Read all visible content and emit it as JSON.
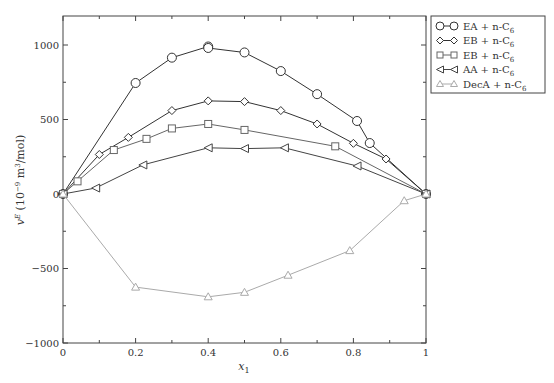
{
  "chart_data": {
    "type": "line",
    "title": "",
    "xlabel": "x_1",
    "ylabel": "v^E (10^-9 m^3/mol)",
    "xlim": [
      0,
      1
    ],
    "ylim": [
      -1000,
      1200
    ],
    "xticks": [
      0,
      0.2,
      0.4,
      0.6,
      0.8,
      1
    ],
    "xtick_labels": [
      "0",
      "0.2",
      "0.4",
      "0.6",
      "0.8",
      "1"
    ],
    "yticks": [
      -1000,
      -500,
      0,
      500,
      1000
    ],
    "ytick_labels": [
      "−1000",
      "−500",
      "0",
      "500",
      "1000"
    ],
    "grid": false,
    "legend_position": "outside-top-right",
    "series": [
      {
        "name": "EA + n-C6",
        "label_main": "EA + n-C",
        "label_sub": "6",
        "marker": "circle",
        "color": "#333333",
        "x": [
          0,
          0.2,
          0.3,
          0.4,
          0.4,
          0.5,
          0.6,
          0.7,
          0.81,
          0.845,
          1
        ],
        "y": [
          0,
          745,
          915,
          990,
          980,
          950,
          825,
          670,
          490,
          342,
          0
        ]
      },
      {
        "name": "EB + n-C6",
        "label_main": "EB + n-C",
        "label_sub": "6",
        "marker": "diamond",
        "color": "#333333",
        "x": [
          0,
          0.1,
          0.18,
          0.3,
          0.4,
          0.5,
          0.6,
          0.7,
          0.8,
          0.89,
          1
        ],
        "y": [
          0,
          265,
          380,
          560,
          625,
          620,
          560,
          470,
          340,
          235,
          0
        ]
      },
      {
        "name": "EB + n-C6",
        "label_main": "EB + n-C",
        "label_sub": "6",
        "marker": "square",
        "color": "#666666",
        "x": [
          0,
          0.04,
          0.14,
          0.23,
          0.3,
          0.4,
          0.5,
          0.75,
          1
        ],
        "y": [
          0,
          85,
          295,
          370,
          440,
          470,
          430,
          320,
          0
        ]
      },
      {
        "name": "AA + n-C6",
        "label_main": "AA + n-C",
        "label_sub": "6",
        "marker": "triangle-left",
        "color": "#444444",
        "x": [
          0,
          0.09,
          0.22,
          0.4,
          0.5,
          0.61,
          0.81,
          1
        ],
        "y": [
          0,
          40,
          195,
          310,
          305,
          310,
          188,
          0
        ]
      },
      {
        "name": "DecA + n-C6",
        "label_main": "DecA + n-C",
        "label_sub": "6",
        "marker": "triangle-up",
        "color": "#aaaaaa",
        "x": [
          0,
          0.2,
          0.4,
          0.5,
          0.62,
          0.79,
          0.94,
          1
        ],
        "y": [
          0,
          -625,
          -690,
          -660,
          -545,
          -380,
          -45,
          0
        ]
      }
    ]
  }
}
